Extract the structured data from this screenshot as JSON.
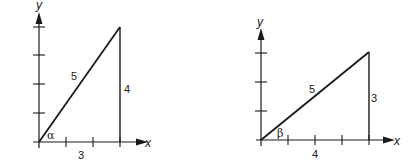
{
  "diagrams": [
    {
      "id": "left",
      "axis_x_label": "x",
      "axis_y_label": "y",
      "hypotenuse_label": "5",
      "vertical_side_label": "4",
      "horizontal_side_label": "3",
      "angle_label": "α",
      "x_ticks": 3,
      "y_ticks": 4
    },
    {
      "id": "right",
      "axis_x_label": "x",
      "axis_y_label": "y",
      "hypotenuse_label": "5",
      "vertical_side_label": "3",
      "horizontal_side_label": "4",
      "angle_label": "β",
      "x_ticks": 4,
      "y_ticks": 3
    }
  ],
  "colors": {
    "stroke": "#1a1a1a",
    "background": "#ffffff"
  }
}
